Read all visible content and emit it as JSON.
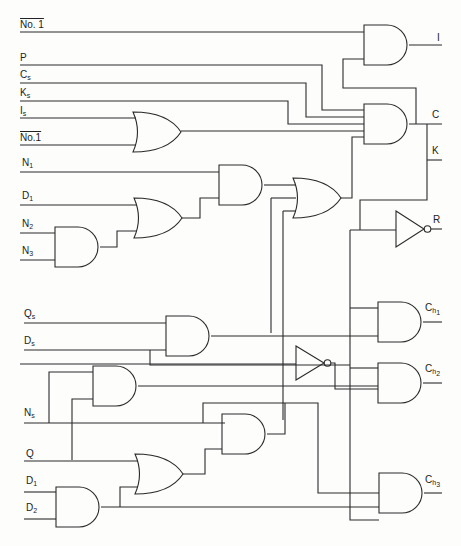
{
  "diagram": {
    "type": "logic-circuit",
    "inputs": [
      {
        "id": "no1_top",
        "text": "No. 1",
        "overline": true,
        "x": 62,
        "y": 22
      },
      {
        "id": "P",
        "text": "P",
        "x": 62,
        "y": 55
      },
      {
        "id": "Cs",
        "text": "C",
        "sub": "s",
        "x": 62,
        "y": 72
      },
      {
        "id": "Ks",
        "text": "K",
        "sub": "s",
        "x": 62,
        "y": 90
      },
      {
        "id": "Is",
        "text": "I",
        "sub": "s",
        "x": 62,
        "y": 108
      },
      {
        "id": "no1_bot",
        "text": "No.1",
        "overline": true,
        "x": 62,
        "y": 127
      },
      {
        "id": "N1",
        "text": "N",
        "sub": "1",
        "x": 22,
        "y": 160
      },
      {
        "id": "D1a",
        "text": "D",
        "sub": "1",
        "x": 22,
        "y": 193
      },
      {
        "id": "N2",
        "text": "N",
        "sub": "2",
        "x": 22,
        "y": 219
      },
      {
        "id": "N3",
        "text": "N",
        "sub": "3",
        "x": 22,
        "y": 246
      },
      {
        "id": "Qs",
        "text": "Q",
        "sub": "s",
        "x": 24,
        "y": 311
      },
      {
        "id": "Ds",
        "text": "D",
        "sub": "s",
        "x": 24,
        "y": 338
      },
      {
        "id": "Ns",
        "text": "N",
        "sub": "s",
        "x": 24,
        "y": 408
      },
      {
        "id": "Q",
        "text": "Q",
        "x": 26,
        "y": 449
      },
      {
        "id": "D1b",
        "text": "D",
        "sub": "1",
        "x": 26,
        "y": 476
      },
      {
        "id": "D2",
        "text": "D",
        "sub": "2",
        "x": 26,
        "y": 503
      }
    ],
    "outputs": [
      {
        "id": "I",
        "text": "I",
        "x": 437,
        "y": 33
      },
      {
        "id": "C",
        "text": "C",
        "x": 432,
        "y": 113
      },
      {
        "id": "K",
        "text": "K",
        "x": 432,
        "y": 148
      },
      {
        "id": "R",
        "text": "R",
        "x": 433,
        "y": 214
      },
      {
        "id": "Ch1",
        "text": "C",
        "sub": "h",
        "sub2": "1",
        "x": 425,
        "y": 303
      },
      {
        "id": "Ch2",
        "text": "C",
        "sub": "h",
        "sub2": "2",
        "x": 425,
        "y": 363
      },
      {
        "id": "Ch3",
        "text": "C",
        "sub": "h",
        "sub2": "3",
        "x": 425,
        "y": 475
      }
    ],
    "gates": [
      {
        "id": "and_I",
        "kind": "AND",
        "x": 364,
        "y": 25,
        "w": 45,
        "h": 40
      },
      {
        "id": "and_C",
        "kind": "AND",
        "x": 364,
        "y": 104,
        "w": 45,
        "h": 40
      },
      {
        "id": "or_top",
        "kind": "OR",
        "x": 133,
        "y": 112,
        "w": 48,
        "h": 40
      },
      {
        "id": "and_mid",
        "kind": "AND",
        "x": 219,
        "y": 165,
        "w": 45,
        "h": 40
      },
      {
        "id": "or_mid1",
        "kind": "OR",
        "x": 134,
        "y": 198,
        "w": 48,
        "h": 40
      },
      {
        "id": "and_n23",
        "kind": "AND",
        "x": 55,
        "y": 227,
        "w": 45,
        "h": 40
      },
      {
        "id": "or_mid2",
        "kind": "OR",
        "x": 293,
        "y": 178,
        "w": 48,
        "h": 40
      },
      {
        "id": "not_R",
        "kind": "NOT",
        "x": 396,
        "y": 211,
        "w": 28,
        "h": 36
      },
      {
        "id": "and_qd",
        "kind": "AND",
        "x": 166,
        "y": 316,
        "w": 45,
        "h": 40
      },
      {
        "id": "and_ch1",
        "kind": "AND",
        "x": 378,
        "y": 302,
        "w": 45,
        "h": 40
      },
      {
        "id": "not_mid",
        "kind": "NOT",
        "x": 296,
        "y": 346,
        "w": 28,
        "h": 34
      },
      {
        "id": "and_ns",
        "kind": "AND",
        "x": 93,
        "y": 366,
        "w": 45,
        "h": 40
      },
      {
        "id": "and_ch2",
        "kind": "AND",
        "x": 378,
        "y": 363,
        "w": 45,
        "h": 40
      },
      {
        "id": "and_low",
        "kind": "AND",
        "x": 222,
        "y": 415,
        "w": 45,
        "h": 40
      },
      {
        "id": "or_low",
        "kind": "OR",
        "x": 135,
        "y": 454,
        "w": 48,
        "h": 40
      },
      {
        "id": "and_d12",
        "kind": "AND",
        "x": 56,
        "y": 487,
        "w": 45,
        "h": 40
      },
      {
        "id": "and_ch3",
        "kind": "AND",
        "x": 379,
        "y": 473,
        "w": 45,
        "h": 40
      }
    ]
  }
}
